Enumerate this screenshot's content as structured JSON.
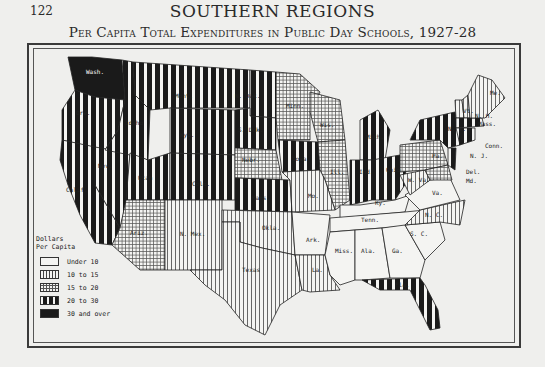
{
  "page": {
    "number": "122",
    "running_head": "SOUTHERN REGIONS",
    "map_title": "Per Capita Total Expenditures in Public Day Schools, 1927-28"
  },
  "legend": {
    "title_line1": "Dollars",
    "title_line2": "Per Capita",
    "items": [
      {
        "label": "Under 10",
        "pattern": "blank"
      },
      {
        "label": "10 to 15",
        "pattern": "thin-vertical"
      },
      {
        "label": "15 to 20",
        "pattern": "crosshatch"
      },
      {
        "label": "20 to 30",
        "pattern": "bold-vertical"
      },
      {
        "label": "30 and over",
        "pattern": "solid-black"
      }
    ]
  },
  "states": {
    "wash": {
      "label": "Wash.",
      "category": "30 and over"
    },
    "ore": {
      "label": "Ore.",
      "category": "20 to 30"
    },
    "calif": {
      "label": "Calif.",
      "category": "20 to 30"
    },
    "idaho": {
      "label": "Idaho",
      "category": "20 to 30"
    },
    "nev": {
      "label": "Nev.",
      "category": "20 to 30"
    },
    "mont": {
      "label": "Mont.",
      "category": "20 to 30"
    },
    "wyo": {
      "label": "Wyo.",
      "category": "20 to 30"
    },
    "utah": {
      "label": "Utah",
      "category": "20 to 30"
    },
    "colo": {
      "label": "Colo.",
      "category": "20 to 30"
    },
    "ariz": {
      "label": "Ariz.",
      "category": "15 to 20"
    },
    "nmex": {
      "label": "N. Mex.",
      "category": "10 to 15"
    },
    "ndak": {
      "label": "N. Dak.",
      "category": "20 to 30"
    },
    "sdak": {
      "label": "S. Dak.",
      "category": "20 to 30"
    },
    "nebr": {
      "label": "Nebr.",
      "category": "15 to 20"
    },
    "kans": {
      "label": "Kans.",
      "category": "20 to 30"
    },
    "okla": {
      "label": "Okla.",
      "category": "10 to 15"
    },
    "texas": {
      "label": "Texas",
      "category": "10 to 15"
    },
    "minn": {
      "label": "Minn.",
      "category": "15 to 20"
    },
    "iowa": {
      "label": "Iowa",
      "category": "20 to 30"
    },
    "mo": {
      "label": "Mo.",
      "category": "10 to 15"
    },
    "ark": {
      "label": "Ark.",
      "category": "Under 10"
    },
    "la": {
      "label": "La.",
      "category": "10 to 15"
    },
    "wis": {
      "label": "Wis.",
      "category": "15 to 20"
    },
    "ill": {
      "label": "Ill.",
      "category": "15 to 20"
    },
    "mich": {
      "label": "Mich.",
      "category": "20 to 30"
    },
    "ind": {
      "label": "Ind.",
      "category": "20 to 30"
    },
    "ohio": {
      "label": "Ohio",
      "category": "20 to 30"
    },
    "ky": {
      "label": "Ky.",
      "category": "Under 10"
    },
    "tenn": {
      "label": "Tenn.",
      "category": "Under 10"
    },
    "miss": {
      "label": "Miss.",
      "category": "Under 10"
    },
    "ala": {
      "label": "Ala.",
      "category": "Under 10"
    },
    "ga": {
      "label": "Ga.",
      "category": "Under 10"
    },
    "fla": {
      "label": "Fla.",
      "category": "20 to 30"
    },
    "sc": {
      "label": "S. C.",
      "category": "Under 10"
    },
    "nc": {
      "label": "N. C.",
      "category": "10 to 15"
    },
    "va": {
      "label": "Va.",
      "category": "Under 10"
    },
    "wva": {
      "label": "W. Va.",
      "category": "10 to 15"
    },
    "pa": {
      "label": "Pa.",
      "category": "15 to 20"
    },
    "ny": {
      "label": "N. Y.",
      "category": "20 to 30"
    },
    "nj": {
      "label": "N. J.",
      "category": "20 to 30"
    },
    "del": {
      "label": "Del.",
      "category": "15 to 20"
    },
    "md": {
      "label": "Md.",
      "category": "15 to 20"
    },
    "conn": {
      "label": "Conn.",
      "category": "20 to 30"
    },
    "mass": {
      "label": "Mass.",
      "category": "20 to 30"
    },
    "vt": {
      "label": "Vt.",
      "category": "10 to 15"
    },
    "nh": {
      "label": "N. H.",
      "category": "10 to 15"
    },
    "me": {
      "label": "Me.",
      "category": "10 to 15"
    }
  }
}
